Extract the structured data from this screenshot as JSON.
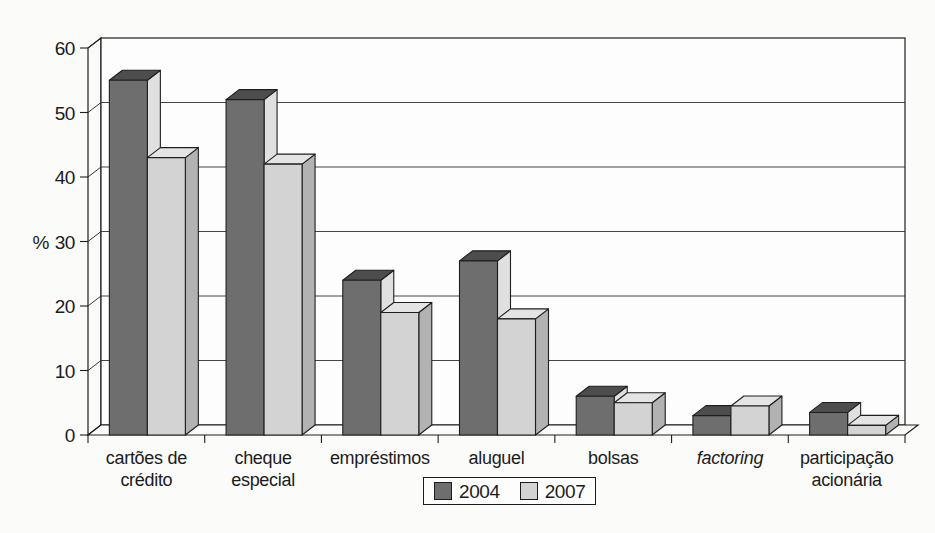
{
  "figure": {
    "background": "#fbfbfa",
    "text_color": "#1c1c1c",
    "outline_color": "#1f1f1f"
  },
  "chart_data": {
    "type": "bar",
    "style": "3d-column",
    "title": "",
    "xlabel": "",
    "ylabel": "%",
    "ylim": [
      0,
      60
    ],
    "yticks": [
      0,
      10,
      20,
      30,
      40,
      50,
      60
    ],
    "grid": true,
    "legend_position": "bottom-center",
    "categories": [
      {
        "label": "cartões de crédito",
        "lines": [
          "cartões de",
          "crédito"
        ],
        "italic": false
      },
      {
        "label": "cheque especial",
        "lines": [
          "cheque",
          "especial"
        ],
        "italic": false
      },
      {
        "label": "empréstimos",
        "lines": [
          "empréstimos"
        ],
        "italic": false
      },
      {
        "label": "aluguel",
        "lines": [
          "aluguel"
        ],
        "italic": false
      },
      {
        "label": "bolsas",
        "lines": [
          "bolsas"
        ],
        "italic": false
      },
      {
        "label": "factoring",
        "lines": [
          "factoring"
        ],
        "italic": true
      },
      {
        "label": "participação acionária",
        "lines": [
          "participação",
          "acionária"
        ],
        "italic": false
      }
    ],
    "series": [
      {
        "name": "2004",
        "front_color": "#6e6e6e",
        "top_color": "#4d4d4d",
        "side_color": "#e0e0e0",
        "values": [
          55,
          52,
          24,
          27,
          6,
          3,
          3.5
        ]
      },
      {
        "name": "2007",
        "front_color": "#d3d3d3",
        "top_color": "#e4e4e4",
        "side_color": "#b2b2b2",
        "values": [
          43,
          42,
          19,
          18,
          5,
          4.5,
          1.5
        ]
      }
    ]
  },
  "legend": {
    "items": [
      {
        "label": "2004"
      },
      {
        "label": "2007"
      }
    ]
  }
}
